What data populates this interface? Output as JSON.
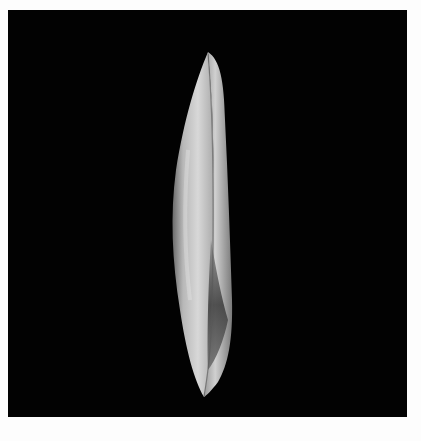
{
  "image": {
    "subject": "white elongated shell on black background",
    "background_color": "#020202",
    "border_color": "#fdfdfd"
  }
}
